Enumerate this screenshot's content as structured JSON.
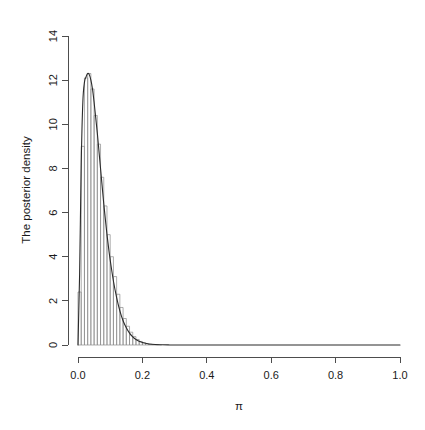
{
  "chart_data": {
    "type": "area",
    "title": "",
    "subtitle": "",
    "xlabel": "π",
    "ylabel": "The posterior density",
    "xlim": [
      0.0,
      1.0
    ],
    "ylim": [
      0.0,
      14.0
    ],
    "grid": false,
    "legend": null,
    "xticks": [
      0.0,
      0.2,
      0.4,
      0.6,
      0.8,
      1.0
    ],
    "xtick_labels": [
      "0.0",
      "0.2",
      "0.4",
      "0.6",
      "0.8",
      "1.0"
    ],
    "yticks": [
      0,
      2,
      4,
      6,
      8,
      10,
      12,
      14
    ],
    "ytick_labels": [
      "0",
      "2",
      "4",
      "6",
      "8",
      "10",
      "12",
      "14"
    ],
    "series": [
      {
        "name": "posterior histogram",
        "type": "histogram",
        "bin_width": 0.01,
        "bin_left_edges": [
          0.0,
          0.01,
          0.02,
          0.03,
          0.04,
          0.05,
          0.06,
          0.07,
          0.08,
          0.09,
          0.1,
          0.11,
          0.12,
          0.13,
          0.14,
          0.15,
          0.16,
          0.17,
          0.18,
          0.19,
          0.2,
          0.21,
          0.22,
          0.23,
          0.24,
          0.25
        ],
        "values": [
          2.4,
          9.0,
          12.1,
          12.3,
          11.6,
          10.4,
          9.1,
          7.6,
          6.3,
          5.0,
          4.0,
          3.1,
          2.3,
          1.7,
          1.2,
          0.85,
          0.58,
          0.38,
          0.25,
          0.16,
          0.1,
          0.06,
          0.035,
          0.02,
          0.012,
          0.0
        ]
      },
      {
        "name": "posterior density curve",
        "type": "line",
        "x": [
          0.0,
          0.005,
          0.01,
          0.015,
          0.02,
          0.025,
          0.03,
          0.035,
          0.04,
          0.045,
          0.05,
          0.055,
          0.06,
          0.065,
          0.07,
          0.075,
          0.08,
          0.085,
          0.09,
          0.095,
          0.1,
          0.11,
          0.12,
          0.13,
          0.14,
          0.15,
          0.16,
          0.17,
          0.18,
          0.19,
          0.2,
          0.22,
          0.24,
          0.26,
          0.28,
          0.3,
          0.35,
          0.4,
          0.5,
          0.6,
          0.7,
          0.8,
          0.9,
          1.0
        ],
        "y": [
          0.0,
          3.2,
          8.2,
          11.0,
          11.9,
          12.15,
          12.3,
          12.25,
          12.0,
          11.6,
          11.0,
          10.3,
          9.6,
          8.8,
          8.0,
          7.2,
          6.4,
          5.7,
          5.0,
          4.4,
          3.85,
          2.9,
          2.15,
          1.55,
          1.1,
          0.78,
          0.54,
          0.37,
          0.25,
          0.17,
          0.11,
          0.048,
          0.02,
          0.009,
          0.004,
          0.002,
          0.0,
          0.0,
          0.0,
          0.0,
          0.0,
          0.0,
          0.0,
          0.0
        ]
      }
    ]
  },
  "axes": {
    "x_axis_name": "pi-axis",
    "y_axis_name": "density-axis"
  }
}
